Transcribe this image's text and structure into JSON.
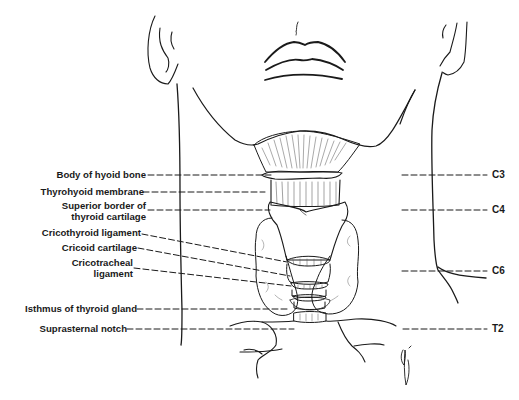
{
  "figure": {
    "type": "anatomical-illustration"
  },
  "labels_left": [
    {
      "id": "hyoid",
      "text": "Body of hyoid bone"
    },
    {
      "id": "thyrohyoid",
      "text": "Thyrohyoid membrane"
    },
    {
      "id": "superior-border-1",
      "text": "Superior border of"
    },
    {
      "id": "superior-border-2",
      "text": "thyroid cartilage"
    },
    {
      "id": "cricothyroid",
      "text": "Cricothyroid ligament"
    },
    {
      "id": "cricoid",
      "text": "Cricoid cartilage"
    },
    {
      "id": "cricotracheal-1",
      "text": "Cricotracheal"
    },
    {
      "id": "cricotracheal-2",
      "text": "ligament"
    },
    {
      "id": "isthmus",
      "text": "Isthmus of thyroid gland"
    },
    {
      "id": "suprasternal",
      "text": "Suprasternal notch"
    }
  ],
  "vertebral_levels": [
    {
      "id": "c3",
      "text": "C3"
    },
    {
      "id": "c4",
      "text": "C4"
    },
    {
      "id": "c6",
      "text": "C6"
    },
    {
      "id": "t2",
      "text": "T2"
    }
  ],
  "colors": {
    "ink": "#1a1a1a",
    "background": "#ffffff"
  }
}
